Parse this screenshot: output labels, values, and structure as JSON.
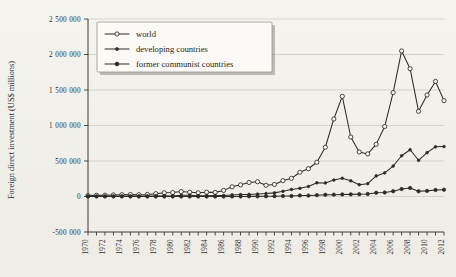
{
  "chart_data": {
    "type": "line",
    "title": "",
    "xlabel": "",
    "ylabel": "Foreign direct investment (US$ millions)",
    "xlim": [
      1970,
      2012
    ],
    "ylim": [
      -500000,
      2500000
    ],
    "grid": true,
    "legend_position": "top-left",
    "y_ticks": [
      -500000,
      0,
      500000,
      1000000,
      1500000,
      2000000,
      2500000
    ],
    "y_tick_labels": [
      "-500 000",
      "0",
      "500 000",
      "1 000 000",
      "1 500 000",
      "2 000 000",
      "2 500 000"
    ],
    "x_ticks": [
      1970,
      1971,
      1972,
      1973,
      1974,
      1975,
      1976,
      1977,
      1978,
      1979,
      1980,
      1981,
      1982,
      1983,
      1984,
      1985,
      1986,
      1987,
      1988,
      1989,
      1990,
      1991,
      1992,
      1993,
      1994,
      1995,
      1996,
      1997,
      1998,
      1999,
      2000,
      2001,
      2002,
      2003,
      2004,
      2005,
      2006,
      2007,
      2008,
      2009,
      2010,
      2011,
      2012
    ],
    "x_tick_labels": [
      "1970",
      "1972",
      "1974",
      "1976",
      "1978",
      "1980",
      "1982",
      "1984",
      "1986",
      "1988",
      "1990",
      "1992",
      "1994",
      "1996",
      "1998",
      "2000",
      "2002",
      "2004",
      "2006",
      "2008",
      "2010",
      "2012"
    ],
    "x_labelled_ticks": [
      1970,
      1972,
      1974,
      1976,
      1978,
      1980,
      1982,
      1984,
      1986,
      1988,
      1990,
      1992,
      1994,
      1996,
      1998,
      2000,
      2002,
      2004,
      2006,
      2008,
      2010,
      2012
    ],
    "x": [
      1970,
      1971,
      1972,
      1973,
      1974,
      1975,
      1976,
      1977,
      1978,
      1979,
      1980,
      1981,
      1982,
      1983,
      1984,
      1985,
      1986,
      1987,
      1988,
      1989,
      1990,
      1991,
      1992,
      1993,
      1994,
      1995,
      1996,
      1997,
      1998,
      1999,
      2000,
      2001,
      2002,
      2003,
      2004,
      2005,
      2006,
      2007,
      2008,
      2009,
      2010,
      2011,
      2012
    ],
    "series": [
      {
        "name": "world",
        "marker": "open-circle",
        "color": "#2b2b29",
        "values": [
          13000,
          16000,
          18000,
          22000,
          25000,
          27000,
          25000,
          29000,
          40000,
          52000,
          55000,
          70000,
          60000,
          52000,
          60000,
          58000,
          86000,
          136000,
          164000,
          197000,
          208000,
          158000,
          170000,
          223000,
          256000,
          342000,
          391000,
          482000,
          694000,
          1092000,
          1410000,
          838000,
          627000,
          600000,
          734000,
          985000,
          1463000,
          2050000,
          1800000,
          1200000,
          1430000,
          1620000,
          1350000
        ]
      },
      {
        "name": "developing countries",
        "marker": "small-filled-circle",
        "color": "#2b2b29",
        "values": [
          3900,
          4200,
          4600,
          5800,
          4900,
          6800,
          5500,
          6500,
          8500,
          11000,
          8400,
          17000,
          19000,
          10000,
          11000,
          14000,
          14000,
          22000,
          27000,
          29000,
          34000,
          41000,
          51000,
          73000,
          99000,
          115000,
          141000,
          193000,
          191000,
          232000,
          256000,
          221000,
          166000,
          180000,
          290000,
          332000,
          429000,
          574000,
          658000,
          510000,
          617000,
          700000,
          703000
        ]
      },
      {
        "name": "former communist countries",
        "marker": "filled-circle",
        "color": "#2b2b29",
        "values": [
          0,
          0,
          0,
          0,
          0,
          0,
          0,
          0,
          0,
          0,
          0,
          0,
          0,
          0,
          0,
          0,
          0,
          1000,
          1000,
          3000,
          2000,
          3000,
          5000,
          6000,
          6000,
          14000,
          13000,
          19000,
          24000,
          26000,
          29000,
          30000,
          32000,
          36000,
          52000,
          56000,
          74000,
          105000,
          120000,
          73000,
          79000,
          92000,
          96000
        ]
      }
    ]
  },
  "legend": {
    "items": [
      {
        "label": "world"
      },
      {
        "label": "developing countries"
      },
      {
        "label": "former communist countries"
      }
    ]
  }
}
